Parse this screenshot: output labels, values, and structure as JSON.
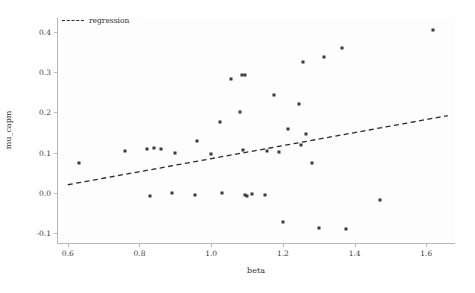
{
  "chart_data": {
    "type": "scatter",
    "title": "",
    "xlabel": "beta",
    "ylabel": "mu_capm",
    "xlim": [
      0.57,
      1.68
    ],
    "ylim": [
      -0.125,
      0.435
    ],
    "xticks": [
      "0.6",
      "0.8",
      "1.0",
      "1.2",
      "1.4",
      "1.6"
    ],
    "xtick_values": [
      0.6,
      0.8,
      1.0,
      1.2,
      1.4,
      1.6
    ],
    "yticks": [
      "-0.1",
      "0.0",
      "0.1",
      "0.2",
      "0.3",
      "0.4"
    ],
    "ytick_values": [
      -0.1,
      0.0,
      0.1,
      0.2,
      0.3,
      0.4
    ],
    "grid": false,
    "legend_position": "upper left",
    "marker_color": "#3a3a3a",
    "line_color": "#2b2b2b",
    "series": [
      {
        "name": "observations",
        "type": "scatter",
        "points": [
          [
            0.63,
            0.075
          ],
          [
            0.76,
            0.103
          ],
          [
            0.82,
            0.108
          ],
          [
            0.84,
            0.112
          ],
          [
            0.86,
            0.108
          ],
          [
            0.9,
            0.098
          ],
          [
            0.83,
            -0.008
          ],
          [
            0.89,
            0.0
          ],
          [
            0.955,
            -0.005
          ],
          [
            0.96,
            0.128
          ],
          [
            1.0,
            0.096
          ],
          [
            1.025,
            0.176
          ],
          [
            1.03,
            0.0
          ],
          [
            1.055,
            0.282
          ],
          [
            1.08,
            0.2
          ],
          [
            1.085,
            0.293
          ],
          [
            1.095,
            0.292
          ],
          [
            1.09,
            0.107
          ],
          [
            1.095,
            -0.005
          ],
          [
            1.1,
            -0.008
          ],
          [
            1.115,
            -0.004
          ],
          [
            1.15,
            -0.006
          ],
          [
            1.155,
            0.105
          ],
          [
            1.175,
            0.243
          ],
          [
            1.19,
            0.102
          ],
          [
            1.2,
            -0.072
          ],
          [
            1.215,
            0.158
          ],
          [
            1.245,
            0.222
          ],
          [
            1.25,
            0.12
          ],
          [
            1.255,
            0.325
          ],
          [
            1.265,
            0.146
          ],
          [
            1.28,
            0.075
          ],
          [
            1.3,
            -0.088
          ],
          [
            1.315,
            0.338
          ],
          [
            1.365,
            0.36
          ],
          [
            1.375,
            -0.09
          ],
          [
            1.47,
            -0.018
          ],
          [
            1.62,
            0.405
          ]
        ]
      },
      {
        "name": "regression",
        "type": "line",
        "style": "dashed",
        "endpoints": [
          [
            0.6,
            0.02
          ],
          [
            1.66,
            0.192
          ]
        ],
        "slope": 0.162,
        "intercept": -0.077
      }
    ]
  },
  "legend": {
    "label": "regression"
  }
}
